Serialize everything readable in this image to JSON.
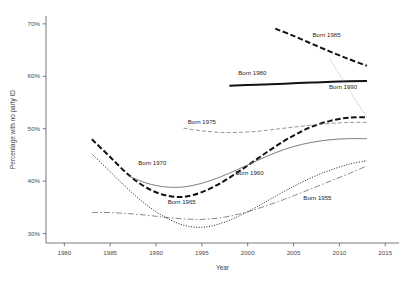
{
  "chart_data": {
    "type": "line",
    "title": "",
    "xlabel": "Year",
    "ylabel": "Percentage with no party ID",
    "xlim": [
      1978,
      2016.5
    ],
    "ylim": [
      28.2,
      71.5
    ],
    "xticks": [
      1980,
      1985,
      1990,
      1995,
      2000,
      2005,
      2010,
      2015
    ],
    "xtick_labels": [
      "1980",
      "1985",
      "1990",
      "1995",
      "2000",
      "2005",
      "2010",
      "2015"
    ],
    "yticks": [
      30,
      40,
      50,
      60,
      70
    ],
    "ytick_labels": [
      "30%",
      "40%",
      "50%",
      "60%",
      "70%"
    ],
    "grid": false,
    "legend_position": "inline-annotations",
    "series": [
      {
        "name": "Born 1955",
        "label": "Born 1955",
        "style": "dash-dot",
        "dasharray": "6,2.2,1.6,2.2",
        "width": 0.9,
        "color": "#7b7b7b",
        "label_x": 2007.6,
        "label_y": 36.4,
        "x": [
          1983,
          1985,
          1987,
          1989,
          1991,
          1993,
          1995,
          1997,
          1999,
          2001,
          2003,
          2005,
          2007,
          2009,
          2011,
          2013
        ],
        "y": [
          34.0,
          34.0,
          33.8,
          33.5,
          33.1,
          32.8,
          32.7,
          33.0,
          33.7,
          34.7,
          35.9,
          37.2,
          38.6,
          40.0,
          41.4,
          42.9
        ]
      },
      {
        "name": "Born 1960",
        "label": "Born 1960",
        "style": "dotted",
        "dasharray": "1,1.6",
        "width": 1.0,
        "color": "#1f1f1f",
        "label_x": 2000.2,
        "label_y": 41.2,
        "x": [
          1983,
          1985,
          1987,
          1989,
          1991,
          1993,
          1995,
          1997,
          1999,
          2001,
          2003,
          2005,
          2007,
          2009,
          2011,
          2013
        ],
        "y": [
          45.2,
          41.8,
          38.4,
          35.4,
          33.1,
          31.6,
          31.2,
          31.9,
          33.3,
          35.1,
          37.1,
          39.0,
          40.7,
          42.1,
          43.2,
          43.9
        ]
      },
      {
        "name": "Born 1965",
        "label": "Born 1965",
        "style": "thick-dashed",
        "dasharray": "5.5,2.6",
        "width": 2.0,
        "color": "#111111",
        "label_x": 1992.8,
        "label_y": 35.7,
        "x": [
          1983,
          1985,
          1987,
          1989,
          1991,
          1993,
          1995,
          1997,
          1999,
          2001,
          2003,
          2005,
          2007,
          2009,
          2011,
          2013
        ],
        "y": [
          48.0,
          44.6,
          41.2,
          38.7,
          37.3,
          37.0,
          37.9,
          39.6,
          41.8,
          44.2,
          46.6,
          48.7,
          50.4,
          51.5,
          52.1,
          52.2
        ]
      },
      {
        "name": "Born 1970",
        "label": "Born 1970",
        "style": "solid-thin",
        "dasharray": "none",
        "width": 0.9,
        "color": "#6e6e6e",
        "label_x": 1989.6,
        "label_y": 43.1,
        "x": [
          1987,
          1989,
          1991,
          1993,
          1995,
          1997,
          1999,
          2001,
          2003,
          2005,
          2007,
          2009,
          2011,
          2013
        ],
        "y": [
          41.0,
          39.6,
          38.9,
          38.9,
          39.6,
          40.8,
          42.3,
          43.9,
          45.4,
          46.6,
          47.4,
          47.9,
          48.1,
          48.1
        ]
      },
      {
        "name": "Born 1975",
        "label": "Born 1975",
        "style": "dashed-thin",
        "dasharray": "4,2.2",
        "width": 0.9,
        "color": "#8a8a8a",
        "label_x": 1995.0,
        "label_y": 50.9,
        "x": [
          1993,
          1995,
          1997,
          1999,
          2001,
          2003,
          2005,
          2007,
          2009,
          2011,
          2013
        ],
        "y": [
          50.1,
          49.6,
          49.3,
          49.3,
          49.5,
          49.9,
          50.3,
          50.7,
          51.0,
          51.2,
          51.2
        ]
      },
      {
        "name": "Born 1980",
        "label": "Born 1980",
        "style": "thick-solid",
        "dasharray": "none",
        "width": 2.0,
        "color": "#111111",
        "label_x": 2000.5,
        "label_y": 60.2,
        "x": [
          1998,
          2001,
          2004,
          2007,
          2010,
          2013
        ],
        "y": [
          58.2,
          58.4,
          58.6,
          58.8,
          59.0,
          59.1
        ]
      },
      {
        "name": "Born 1985",
        "label": "Born 1985",
        "style": "thick-dashed",
        "dasharray": "5.5,2.6",
        "width": 2.0,
        "color": "#111111",
        "label_x": 2008.6,
        "label_y": 67.4,
        "x": [
          2003,
          2005,
          2007,
          2009,
          2011,
          2013
        ],
        "y": [
          69.1,
          67.7,
          66.2,
          64.7,
          63.3,
          62.0
        ]
      },
      {
        "name": "Born 1990",
        "label": "Born 1990",
        "style": "dotted-thin",
        "dasharray": "1,1.5",
        "width": 0.85,
        "color": "#9a9a9a",
        "label_x": 2010.4,
        "label_y": 57.6,
        "x": [
          2009,
          2010,
          2011,
          2012,
          2013
        ],
        "y": [
          63.2,
          60.4,
          57.6,
          54.8,
          52.2
        ]
      }
    ]
  }
}
